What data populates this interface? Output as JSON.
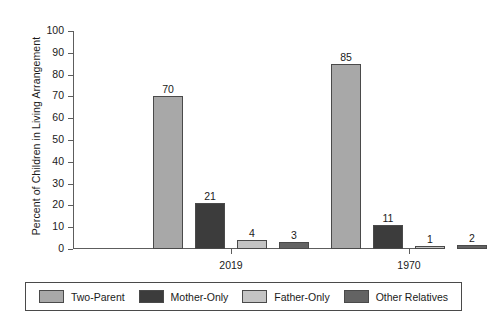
{
  "chart_data": {
    "type": "bar",
    "title": "",
    "xlabel": "",
    "ylabel": "Percent of Children in Living Arrangement",
    "categories": [
      "2019",
      "1970"
    ],
    "ylim": [
      0,
      100
    ],
    "yticks": [
      0,
      10,
      20,
      30,
      40,
      50,
      60,
      70,
      80,
      90,
      100
    ],
    "ytick_labels": [
      "0",
      "10",
      "20",
      "30",
      "40",
      "50",
      "60",
      "70",
      "80",
      "90",
      "100"
    ],
    "grid": false,
    "legend_position": "bottom",
    "series": [
      {
        "name": "Two-Parent",
        "color": "#a8a8a8",
        "values": [
          70,
          85
        ],
        "labels": [
          "70",
          "85"
        ]
      },
      {
        "name": "Mother-Only",
        "color": "#3c3c3c",
        "values": [
          21,
          11
        ],
        "labels": [
          "21",
          "11"
        ]
      },
      {
        "name": "Father-Only",
        "color": "#c4c4c4",
        "values": [
          4,
          1
        ],
        "labels": [
          "4",
          "1"
        ]
      },
      {
        "name": "Other Relatives",
        "color": "#636363",
        "values": [
          3,
          2
        ],
        "labels": [
          "3",
          "2"
        ]
      }
    ]
  },
  "legend": {
    "items": [
      {
        "label": "Two-Parent",
        "color": "#a8a8a8"
      },
      {
        "label": "Mother-Only",
        "color": "#3c3c3c"
      },
      {
        "label": "Father-Only",
        "color": "#c4c4c4"
      },
      {
        "label": "Other Relatives",
        "color": "#636363"
      }
    ]
  },
  "axis": {
    "line_color": "#5d5d5d",
    "bar_border_color": "#4a4a4a"
  }
}
